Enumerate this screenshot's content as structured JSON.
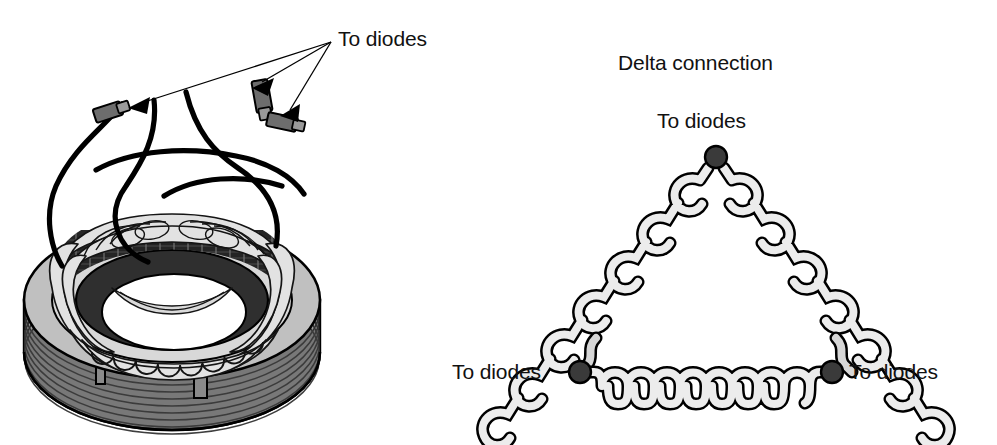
{
  "figure": {
    "background_color": "#ffffff",
    "width": 997,
    "height": 445
  },
  "stator_illustration": {
    "name": "alternator-stator",
    "callout_label": "To diodes",
    "callout_arrow_count": 3,
    "connector_count": 3,
    "lead_wire_count": 3,
    "colors": {
      "outline": "#000000",
      "core_dark": "#3a3a3a",
      "body_gray": "#b5b5b5",
      "winding_light": "#e8e8e8",
      "lead_wire": "#000000"
    }
  },
  "delta_diagram": {
    "title": "Delta connection",
    "terminals": [
      {
        "id": "top",
        "label": "To diodes",
        "x": 716,
        "y": 157
      },
      {
        "id": "left",
        "label": "To diodes",
        "x": 580,
        "y": 372
      },
      {
        "id": "right",
        "label": "To diodes",
        "x": 832,
        "y": 372
      }
    ],
    "windings": [
      {
        "id": "left-leg",
        "from": "top",
        "to": "left",
        "turns": 9
      },
      {
        "id": "right-leg",
        "from": "top",
        "to": "right",
        "turns": 9
      },
      {
        "id": "bottom-leg",
        "from": "left",
        "to": "right",
        "turns": 8
      }
    ],
    "colors": {
      "node_fill": "#3a3a3a",
      "coil_fill": "#e8e8e8",
      "coil_stroke": "#000000",
      "lead_fill": "#cfcfcf"
    }
  }
}
